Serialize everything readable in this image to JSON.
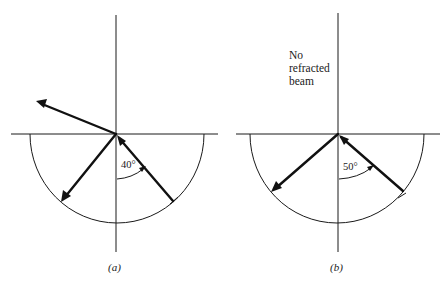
{
  "panels": [
    {
      "id": "a",
      "caption": "(a)",
      "angle_label": "40°",
      "incident_angle_deg": 40,
      "refracted_beam": true
    },
    {
      "id": "b",
      "caption": "(b)",
      "angle_label": "50°",
      "incident_angle_deg": 50,
      "refracted_beam": false,
      "note_lines": [
        "No",
        "refracted",
        "beam"
      ]
    }
  ],
  "colors": {
    "stroke": "#111111",
    "background": "#ffffff"
  }
}
